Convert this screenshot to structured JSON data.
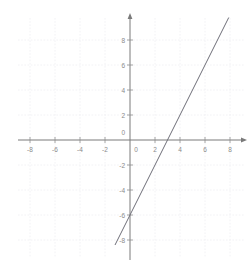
{
  "chart_data": {
    "type": "line",
    "title": "",
    "subtitle": "",
    "xlabel": "",
    "ylabel": "",
    "xlim": [
      -9.6,
      9.6
    ],
    "ylim": [
      -9.6,
      9.8
    ],
    "grid": true,
    "grid_step": 2,
    "legend": "none",
    "x_ticks": [
      -8,
      -6,
      -4,
      -2,
      0,
      2,
      4,
      6,
      8
    ],
    "y_ticks": [
      -8,
      -6,
      -4,
      -2,
      0,
      2,
      4,
      6,
      8
    ],
    "x_tick_labels": [
      "-8",
      "-6",
      "-4",
      "-2",
      "0",
      "2",
      "4",
      "6",
      "8"
    ],
    "y_tick_labels": [
      "-8",
      "-6",
      "-4",
      "-2",
      "0",
      "2",
      "4",
      "6",
      "8"
    ],
    "series": [
      {
        "name": "line",
        "equation": "y = 2x - 6",
        "slope": 2,
        "intercept": -6,
        "x_intercept": 3,
        "color": "#6e6e78",
        "points": [
          {
            "x": -1.2,
            "y": -8.4
          },
          {
            "x": 0,
            "y": -6
          },
          {
            "x": 3,
            "y": 0
          },
          {
            "x": 7.9,
            "y": 9.8
          }
        ]
      }
    ],
    "annotations": [],
    "axis_arrows": {
      "x_right": true,
      "y_top": true
    },
    "colors": {
      "background": "#ffffff",
      "axis": "#7a7a7a",
      "grid": "#efeff3",
      "line": "#6e6e78",
      "tick_text": "#8a8a8a"
    }
  }
}
